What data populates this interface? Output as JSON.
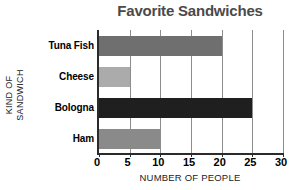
{
  "chart_data": {
    "type": "bar",
    "orientation": "horizontal",
    "title": "Favorite Sandwiches",
    "xlabel": "NUMBER OF PEOPLE",
    "ylabel_lines": [
      "KIND OF",
      "SANDWICH"
    ],
    "ylabel": "KIND OF SANDWICH",
    "categories": [
      "Tuna Fish",
      "Cheese",
      "Bologna",
      "Ham"
    ],
    "values": [
      20,
      5,
      25,
      10
    ],
    "bar_colors": [
      "#6f6f6f",
      "#ababab",
      "#1f1f1f",
      "#8a8a8a"
    ],
    "xlim": [
      0,
      30
    ],
    "xticks": [
      0,
      5,
      10,
      15,
      20,
      25,
      30
    ],
    "xtick_labels": [
      "0",
      "5",
      "10",
      "15",
      "20",
      "25",
      "30"
    ],
    "grid": "vertical",
    "legend": "none",
    "title_color": "#4a4a4a",
    "axis_color": "#2b2b2b",
    "gridline_color": "#8d8d8d",
    "background": "#ffffff"
  }
}
